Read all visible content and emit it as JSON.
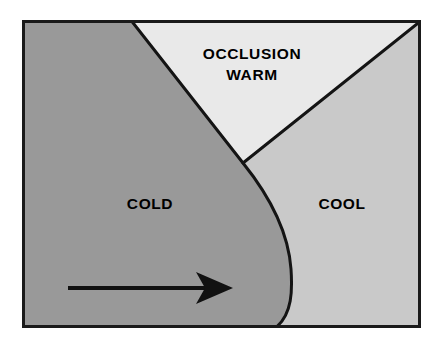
{
  "diagram": {
    "type": "meteorological-occlusion-cross-section",
    "frame": {
      "x": 22,
      "y": 20,
      "width": 399,
      "height": 308,
      "border_color": "#1a1a1a",
      "border_width": 3
    },
    "background_color": "#ffffff",
    "regions": [
      {
        "id": "cold",
        "label": "COLD",
        "color": "#999999",
        "label_x": 150,
        "label_y": 209
      },
      {
        "id": "warm",
        "label_line_1": "OCCLUSION",
        "label_line_2": "WARM",
        "color": "#e9e9e9",
        "label_x": 252,
        "label_y": 59,
        "label2_y": 80
      },
      {
        "id": "cool",
        "label": "COOL",
        "color": "#c9c9c9",
        "label_x": 342,
        "label_y": 209
      }
    ],
    "boundaries": [
      {
        "id": "cold-front-curve",
        "description": "curved cold front separating COLD from WARM and COOL",
        "color": "#141414",
        "width": 3
      },
      {
        "id": "warm-front-line",
        "description": "straight warm front from triple point to upper right corner",
        "color": "#141414",
        "width": 3
      }
    ],
    "triple_point": {
      "x": 243,
      "y": 163
    },
    "arrow": {
      "id": "motion-arrow",
      "direction": "right",
      "color": "#111111",
      "tail_x": 68,
      "tip_x": 233,
      "y": 288,
      "shaft_thickness": 4
    }
  }
}
